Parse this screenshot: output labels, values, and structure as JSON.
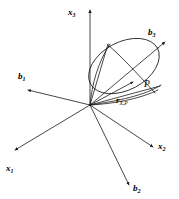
{
  "figure": {
    "background_color": "#ffffff",
    "stroke_color": "#1a1a1a",
    "width": 179,
    "height": 199
  },
  "origin": {
    "label": "origin",
    "x": 90,
    "y": 105
  },
  "axes": [
    {
      "name": "x3",
      "base": "x",
      "sub": "3",
      "label_x": 68,
      "label_y": 2,
      "tip_x": 90,
      "tip_y": 8,
      "kind": "reference-frame"
    },
    {
      "name": "x1",
      "base": "x",
      "sub": "1",
      "label_x": 6,
      "label_y": 158,
      "tip_x": 13,
      "tip_y": 152,
      "kind": "reference-frame"
    },
    {
      "name": "x2",
      "base": "x",
      "sub": "2",
      "label_x": 158,
      "label_y": 136,
      "tip_x": 155,
      "tip_y": 149,
      "kind": "reference-frame"
    },
    {
      "name": "b1",
      "base": "b",
      "sub": "1",
      "label_x": 18,
      "label_y": 66,
      "tip_x": 26,
      "tip_y": 90,
      "kind": "body-frame"
    },
    {
      "name": "b2",
      "base": "b",
      "sub": "2",
      "label_x": 133,
      "label_y": 178,
      "tip_x": 130,
      "tip_y": 187,
      "kind": "body-frame"
    },
    {
      "name": "b3",
      "base": "b",
      "sub": "3",
      "label_x": 148,
      "label_y": 22,
      "tip_x": 167,
      "tip_y": 40,
      "kind": "body-frame"
    }
  ],
  "point": {
    "name": "P",
    "base": "P",
    "label_x": 144,
    "label_y": 74,
    "x": 134,
    "y": 83
  },
  "position_vector": {
    "name": "r_X_P",
    "base": "r",
    "sub": "X,P",
    "label_x": 116,
    "label_y": 90
  },
  "cone": {
    "name": "cone-surface",
    "apex_x": 90,
    "apex_y": 105,
    "rim_center_x": 124,
    "rim_center_y": 66,
    "rim_rx": 38,
    "rim_ry": 24,
    "rim_rotation_deg": -28
  }
}
